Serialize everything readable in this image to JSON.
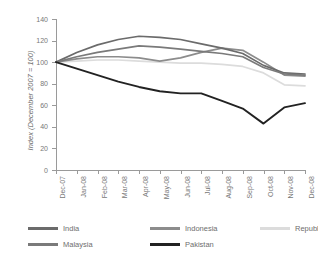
{
  "chart_data": {
    "type": "line",
    "title": "",
    "xlabel": "",
    "ylabel": "Index (December 2007 = 100)",
    "ylim": [
      0,
      140
    ],
    "yticks": [
      0,
      20,
      40,
      60,
      80,
      100,
      120,
      140
    ],
    "grid": false,
    "legend_position": "bottom",
    "categories": [
      "Dec-07",
      "Jan-08",
      "Feb-08",
      "Mar-08",
      "Apr-08",
      "May-08",
      "Jun-08",
      "Jul-08",
      "Aug-08",
      "Sep-08",
      "Oct-08",
      "Nov-08",
      "Dec-08"
    ],
    "series": [
      {
        "name": "India",
        "color": "#6b6b6b",
        "values": [
          100,
          109,
          116,
          121,
          124,
          123,
          121,
          117,
          113,
          108,
          97,
          90,
          89
        ]
      },
      {
        "name": "Indonesia",
        "color": "#8c8c8c",
        "values": [
          100,
          103,
          105,
          105,
          104,
          101,
          104,
          109,
          113,
          111,
          100,
          88,
          87
        ]
      },
      {
        "name": "Republic of Korea",
        "color": "#dcdcdc",
        "values": [
          100,
          101,
          102,
          102,
          101,
          100,
          99,
          99,
          98,
          96,
          90,
          79,
          78
        ]
      },
      {
        "name": "Malaysia",
        "color": "#7a7a7a",
        "values": [
          100,
          105,
          109,
          112,
          115,
          114,
          112,
          110,
          108,
          105,
          95,
          89,
          88
        ]
      },
      {
        "name": "Pakistan",
        "color": "#222222",
        "values": [
          100,
          94,
          88,
          82,
          77,
          73,
          71,
          71,
          64,
          57,
          43,
          58,
          62
        ]
      }
    ]
  }
}
